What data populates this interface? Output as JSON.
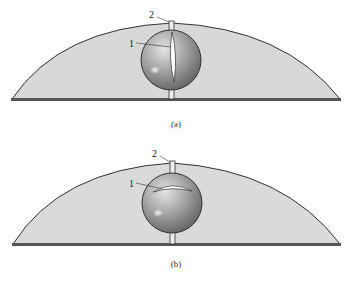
{
  "figure": {
    "panels": [
      {
        "id": "a",
        "caption": "(a)",
        "labels": {
          "crack": "1",
          "peg": "2"
        },
        "crack_orientation": "vertical"
      },
      {
        "id": "b",
        "caption": "(b)",
        "labels": {
          "crack": "1",
          "peg": "2"
        },
        "crack_orientation": "horizontal"
      }
    ],
    "colors": {
      "dome_fill": "#d8d8d8",
      "outline": "#333333",
      "base": "#555555",
      "sphere_light": "#d9d9d9",
      "sphere_dark": "#6e6e6e",
      "crack": "#ffffff"
    }
  }
}
